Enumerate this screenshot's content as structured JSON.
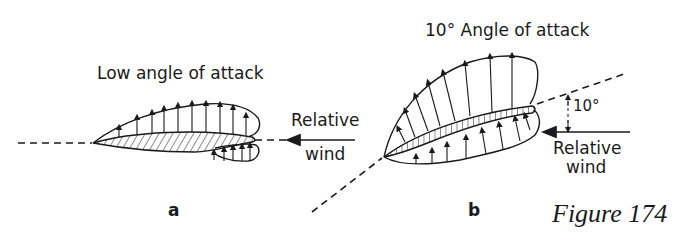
{
  "figure": {
    "caption": "Figure 174",
    "panel_a": {
      "letter": "a",
      "title": "Low angle of attack",
      "wind_label_line1": "Relative",
      "wind_label_line2": "wind"
    },
    "panel_b": {
      "letter": "b",
      "title": "10° Angle of attack",
      "angle_label": "10°",
      "wind_label_line1": "Relative",
      "wind_label_line2": "wind"
    }
  },
  "colors": {
    "ink": "#1a1a1a",
    "background": "#ffffff"
  }
}
